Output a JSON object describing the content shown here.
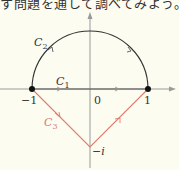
{
  "caption": "す問題を通して調べてみよう。",
  "diagram": {
    "axes": {
      "x_min_px": 0,
      "x_max_px": 176,
      "origin_px": [
        90,
        89
      ],
      "unit_px": 58
    },
    "tick_labels": {
      "neg_one": "−1",
      "zero": "0",
      "one": "1",
      "neg_i": "−i"
    },
    "curves": {
      "C1": {
        "label": "C",
        "sub": "1",
        "description": "segment from -1 to 1 along real axis",
        "color": "#444444"
      },
      "C2": {
        "label": "C",
        "sub": "2",
        "description": "upper semicircle |z|=1 from -1 to 1 (clockwise)",
        "color": "#333333"
      },
      "C3": {
        "label": "C",
        "sub": "3",
        "description": "polyline -1 → -i → 1",
        "color": "#e07a6e"
      }
    },
    "points": [
      "-1",
      "1"
    ],
    "colors": {
      "axis": "#999999",
      "curve": "#333333",
      "c3": "#e07a6e",
      "background": "#fdfcf1"
    }
  }
}
